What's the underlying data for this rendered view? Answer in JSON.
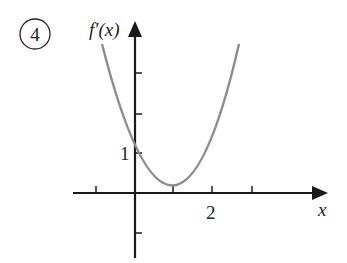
{
  "problem_number": "4",
  "axes": {
    "y_label": "f′(x)",
    "x_label": "x",
    "x_tick_label": "2",
    "y_tick_label": "1"
  },
  "curve": {
    "description": "parabola f'(x) with f'(0)=1, minimum near x=1 below zero, roots near x=0.4 and x=1.6",
    "color": "#8c8c8c"
  },
  "colors": {
    "axis": "#1a1a1a",
    "curve": "#8c8c8c"
  }
}
